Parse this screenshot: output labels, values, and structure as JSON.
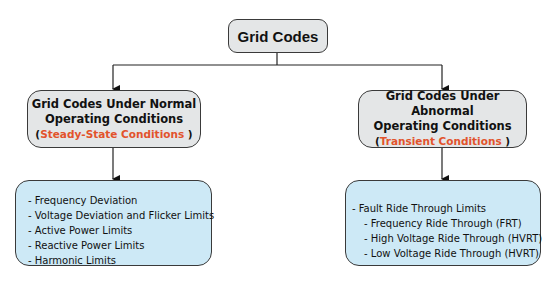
{
  "diagram": {
    "root": {
      "label": "Grid Codes"
    },
    "branches": [
      {
        "title_line1": "Grid Codes Under Normal",
        "title_line2": "Operating Conditions",
        "subtitle_open": "(",
        "subtitle": "Steady-State Conditions",
        "subtitle_close": " )",
        "items": [
          "- Frequency Deviation",
          "- Voltage Deviation and Flicker Limits",
          "- Active Power Limits",
          "- Reactive Power Limits",
          "- Harmonic Limits"
        ]
      },
      {
        "title_line1": "Grid Codes Under Abnormal",
        "title_line2": "Operating Conditions",
        "subtitle_open": "(",
        "subtitle": "Transient Conditions",
        "subtitle_close": " )",
        "items": [
          "- Fault Ride Through Limits",
          "- Frequency Ride Through  (FRT)",
          "- High Voltage Ride Through  (HVRT)",
          "- Low Voltage Ride Through  (HVRT)"
        ]
      }
    ],
    "colors": {
      "accent": "#e2532c",
      "gray_box": "#e4e6e7",
      "blue_box": "#cde9f6",
      "border": "#3a3a3a"
    }
  }
}
